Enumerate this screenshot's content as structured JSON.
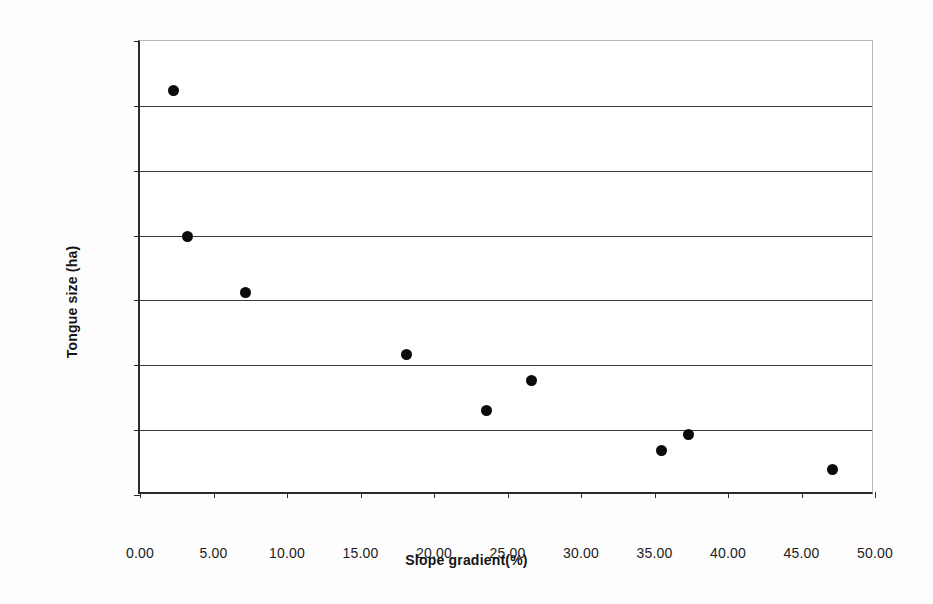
{
  "chart_data": {
    "type": "scatter",
    "title": "",
    "xlabel": "Slope gradient(%)",
    "ylabel": "Tongue size (ha)",
    "xlim": [
      0,
      50
    ],
    "ylim": [
      300,
      370
    ],
    "grid": "horizontal",
    "legend": "none",
    "marker": {
      "shape": "circle",
      "filled": true,
      "color": "#0b0b0b",
      "size_px": 11
    },
    "xticks": [
      "0.00",
      "5.00",
      "10.00",
      "15.00",
      "20.00",
      "25.00",
      "30.00",
      "35.00",
      "40.00",
      "45.00",
      "50.00"
    ],
    "xtick_values": [
      0,
      5,
      10,
      15,
      20,
      25,
      30,
      35,
      40,
      45,
      50
    ],
    "yticks": [
      "300",
      "310",
      "320",
      "330",
      "340",
      "350",
      "360",
      "370"
    ],
    "ytick_values": [
      300,
      310,
      320,
      330,
      340,
      350,
      360,
      370
    ],
    "gridline_values": [
      310,
      320,
      330,
      340,
      350,
      360
    ],
    "series": [
      {
        "name": "Glacier tongues",
        "x": [
          2.3,
          3.2,
          7.2,
          18.1,
          23.6,
          26.6,
          35.5,
          37.3,
          47.1
        ],
        "y": [
          362.4,
          339.8,
          331.2,
          321.6,
          313.1,
          317.6,
          306.8,
          309.4,
          303.9
        ]
      }
    ],
    "points": [
      {
        "x": 2.3,
        "y": 362.4
      },
      {
        "x": 3.2,
        "y": 339.8
      },
      {
        "x": 7.2,
        "y": 331.2
      },
      {
        "x": 18.1,
        "y": 321.6
      },
      {
        "x": 23.6,
        "y": 313.1
      },
      {
        "x": 26.6,
        "y": 317.6
      },
      {
        "x": 35.5,
        "y": 306.8
      },
      {
        "x": 37.3,
        "y": 309.4
      },
      {
        "x": 47.1,
        "y": 303.9
      }
    ]
  }
}
